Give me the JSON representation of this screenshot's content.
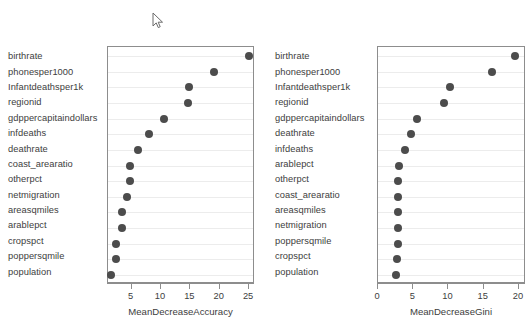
{
  "cursor": {
    "icon": "mouse-pointer-arrow-icon",
    "x": 152,
    "y": 12
  },
  "style": {
    "dot_color": "#4c4c4c",
    "frame_color": "#8d8d8d",
    "grid_color": "#ececec",
    "text_color": "#3d3d3d",
    "background": "#ffffff"
  },
  "chart_data": [
    {
      "type": "scatter",
      "panel": "left",
      "title": "",
      "xlabel": "MeanDecreaseAccuracy",
      "ylabel": "",
      "xlim": [
        1.0,
        26.0
      ],
      "xticks": [
        5,
        10,
        15,
        20,
        25
      ],
      "grid": true,
      "legend": "none",
      "categories": [
        "birthrate",
        "phonesper1000",
        "Infantdeathsper1k",
        "regionid",
        "gdppercapitaindollars",
        "infdeaths",
        "deathrate",
        "coast_arearatio",
        "otherpct",
        "netmigration",
        "areasqmiles",
        "arablepct",
        "cropspct",
        "poppersqmile",
        "population"
      ],
      "values": [
        24.9,
        19.1,
        14.8,
        14.6,
        10.6,
        8.0,
        6.1,
        4.8,
        4.8,
        4.2,
        3.4,
        3.3,
        2.4,
        2.4,
        1.5
      ]
    },
    {
      "type": "scatter",
      "panel": "right",
      "title": "",
      "xlabel": "MeanDecreaseGini",
      "ylabel": "",
      "xlim": [
        0.0,
        21.0
      ],
      "xticks": [
        0,
        5,
        10,
        15,
        20
      ],
      "grid": true,
      "legend": "none",
      "categories": [
        "birthrate",
        "phonesper1000",
        "Infantdeathsper1k",
        "regionid",
        "gdppercapitaindollars",
        "deathrate",
        "infdeaths",
        "arablepct",
        "otherpct",
        "coast_arearatio",
        "areasqmiles",
        "netmigration",
        "poppersqmile",
        "cropspct",
        "population"
      ],
      "values": [
        19.4,
        16.2,
        10.2,
        9.3,
        5.6,
        4.7,
        3.8,
        3.0,
        2.9,
        2.9,
        2.9,
        2.9,
        2.8,
        2.7,
        2.6
      ]
    }
  ]
}
